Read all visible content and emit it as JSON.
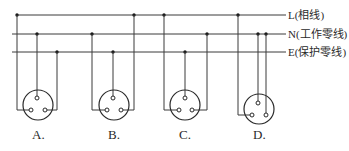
{
  "lines": [
    {
      "id": "L",
      "label": "L(相线)",
      "y": 15
    },
    {
      "id": "N",
      "label": "N(工作零线)",
      "y": 34
    },
    {
      "id": "E",
      "label": "E(保护零线)",
      "y": 52
    }
  ],
  "sockets": [
    {
      "label": "A.",
      "left_hole": "L",
      "top_hole": "N",
      "right_hole": "E"
    },
    {
      "label": "B.",
      "left_hole": "N",
      "top_hole": "E",
      "right_hole": "L"
    },
    {
      "label": "C.",
      "left_hole": "L",
      "top_hole": "E",
      "right_hole": "N"
    },
    {
      "label": "D.",
      "left_hole": "L",
      "top_hole": "N",
      "right_hole": "N"
    }
  ],
  "colors": {
    "line": "#3a3a3a",
    "background": "#ffffff"
  }
}
